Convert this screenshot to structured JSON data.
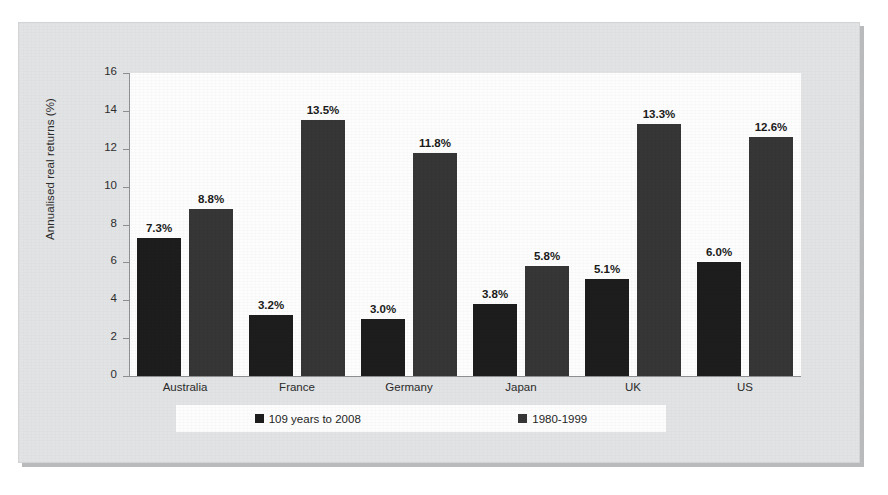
{
  "chart_data": {
    "type": "bar",
    "title": "",
    "xlabel": "",
    "ylabel": "Annualised real returns (%)",
    "ylim": [
      0,
      16
    ],
    "yticks": [
      "0",
      "2",
      "4",
      "6",
      "8",
      "10",
      "12",
      "14",
      "16"
    ],
    "grid": false,
    "legend_position": "bottom",
    "categories": [
      "Australia",
      "France",
      "Germany",
      "Japan",
      "UK",
      "US"
    ],
    "series": [
      {
        "name": "109 years to 2008",
        "color": "#1d1d1d",
        "values": [
          7.3,
          3.2,
          3.0,
          3.8,
          5.1,
          6.0
        ],
        "labels": [
          "7.3%",
          "3.2%",
          "3.0%",
          "3.8%",
          "5.1%",
          "6.0%"
        ]
      },
      {
        "name": "1980-1999",
        "color": "#363636",
        "values": [
          8.8,
          13.5,
          11.8,
          5.8,
          13.3,
          12.6
        ],
        "labels": [
          "8.8%",
          "13.5%",
          "11.8%",
          "5.8%",
          "13.3%",
          "12.6%"
        ]
      }
    ]
  }
}
